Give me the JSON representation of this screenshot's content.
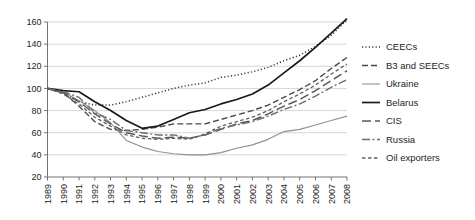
{
  "chart_data": {
    "type": "line",
    "title": "",
    "subtitle": "",
    "xlabel": "",
    "ylabel": "",
    "grid": "horizontal",
    "legend_position": "right",
    "xlim": [
      1989,
      2008
    ],
    "ylim": [
      20,
      160
    ],
    "ytick_step": 20,
    "yticks": [
      20,
      40,
      60,
      80,
      100,
      120,
      140,
      160
    ],
    "x": [
      1989,
      1990,
      1991,
      1992,
      1993,
      1994,
      1995,
      1996,
      1997,
      1998,
      1999,
      2000,
      2001,
      2002,
      2003,
      2004,
      2005,
      2006,
      2007,
      2008
    ],
    "categories": [
      "1989",
      "1990",
      "1991",
      "1992",
      "1993",
      "1994",
      "1995",
      "1996",
      "1997",
      "1998",
      "1999",
      "2000",
      "2001",
      "2002",
      "2003",
      "2004",
      "2005",
      "2006",
      "2007",
      "2008"
    ],
    "series": [
      {
        "name": "CEECs",
        "style": "dotted",
        "color": "#3b3b3b",
        "width": 1.5,
        "dasharray": "1.2,2.2",
        "values": [
          100,
          96,
          88,
          85,
          85,
          88,
          92,
          96,
          100,
          103,
          105,
          110,
          112,
          115,
          119,
          125,
          130,
          138,
          148,
          162
        ]
      },
      {
        "name": "B3 and SEECs",
        "style": "dashed",
        "color": "#4a4a4a",
        "width": 1.4,
        "dasharray": "6,3",
        "values": [
          100,
          96,
          84,
          70,
          63,
          62,
          63,
          65,
          68,
          68,
          68,
          72,
          76,
          80,
          85,
          92,
          99,
          107,
          118,
          128
        ]
      },
      {
        "name": "Ukraine",
        "style": "solid",
        "color": "#8c9095",
        "width": 1.1,
        "dasharray": "none",
        "values": [
          100,
          97,
          89,
          80,
          69,
          53,
          47,
          43,
          41,
          40,
          40,
          42,
          46,
          49,
          54,
          61,
          63,
          67,
          71,
          75
        ]
      },
      {
        "name": "Belarus",
        "style": "solid",
        "color": "#1a1a1a",
        "width": 1.7,
        "dasharray": "none",
        "values": [
          100,
          98,
          97,
          88,
          80,
          71,
          64,
          66,
          72,
          78,
          81,
          86,
          90,
          95,
          103,
          114,
          125,
          137,
          150,
          163
        ]
      },
      {
        "name": "CIS",
        "style": "long-dash",
        "color": "#58595b",
        "width": 1.5,
        "dasharray": "9,4",
        "values": [
          100,
          96,
          88,
          77,
          68,
          60,
          57,
          55,
          56,
          55,
          58,
          63,
          68,
          71,
          77,
          84,
          90,
          98,
          107,
          116
        ]
      },
      {
        "name": "Russia",
        "style": "dash-dot",
        "color": "#6a6c6e",
        "width": 1.4,
        "dasharray": "8,2.5,2,2.5",
        "values": [
          100,
          97,
          92,
          78,
          72,
          62,
          60,
          58,
          58,
          55,
          58,
          64,
          67,
          70,
          75,
          81,
          86,
          93,
          101,
          108
        ]
      },
      {
        "name": "Oil exporters",
        "style": "fine-dash",
        "color": "#5d6063",
        "width": 1.3,
        "dasharray": "3.5,2.5",
        "values": [
          100,
          95,
          86,
          74,
          66,
          58,
          55,
          54,
          55,
          54,
          59,
          66,
          70,
          74,
          80,
          88,
          95,
          103,
          113,
          122
        ]
      }
    ]
  },
  "legend": {
    "items": [
      {
        "label": "CEECs"
      },
      {
        "label": "B3 and SEECs"
      },
      {
        "label": "Ukraine"
      },
      {
        "label": "Belarus"
      },
      {
        "label": "CIS"
      },
      {
        "label": "Russia"
      },
      {
        "label": "Oil exporters"
      }
    ]
  }
}
